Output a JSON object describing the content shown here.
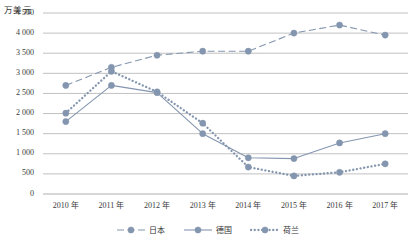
{
  "chart_data": {
    "type": "line",
    "title": "",
    "subtitle": "",
    "xlabel": "",
    "ylabel": "万美元",
    "ylim": [
      0,
      4500
    ],
    "ytick_step": 500,
    "grid": true,
    "legend_position": "bottom",
    "categories": [
      "2010 年",
      "2011 年",
      "2012 年",
      "2013 年",
      "2014 年",
      "2015 年",
      "2016 年",
      "2017 年"
    ],
    "x": [
      2010,
      2011,
      2012,
      2013,
      2014,
      2015,
      2016,
      2017
    ],
    "ytick_labels": [
      "0",
      "500",
      "1 000",
      "1 500",
      "2 000",
      "2 500",
      "3 000",
      "3 500",
      "4 000",
      "4 500"
    ],
    "ytick_values": [
      0,
      500,
      1000,
      1500,
      2000,
      2500,
      3000,
      3500,
      4000,
      4500
    ],
    "series": [
      {
        "name": "日本",
        "line_style": "dashed",
        "color": "#8496AF",
        "values": [
          2700,
          3150,
          3450,
          3550,
          3550,
          4000,
          4200,
          3950
        ]
      },
      {
        "name": "德国",
        "line_style": "solid",
        "color": "#8496AF",
        "values": [
          1800,
          2700,
          2520,
          1500,
          900,
          880,
          1270,
          1500
        ]
      },
      {
        "name": "荷兰",
        "line_style": "dotted",
        "color": "#8496AF",
        "values": [
          2010,
          3050,
          2540,
          1760,
          670,
          450,
          540,
          750
        ]
      }
    ]
  },
  "colors": {
    "marker": "#8496AF",
    "line": "#8496AF",
    "grid": "#a6a6a6",
    "text": "#3a3a3a",
    "background": "#ffffff"
  },
  "legend": {
    "items": [
      {
        "label": "日本",
        "style": "dashed"
      },
      {
        "label": "德国",
        "style": "solid"
      },
      {
        "label": "荷兰",
        "style": "dotted"
      }
    ]
  }
}
